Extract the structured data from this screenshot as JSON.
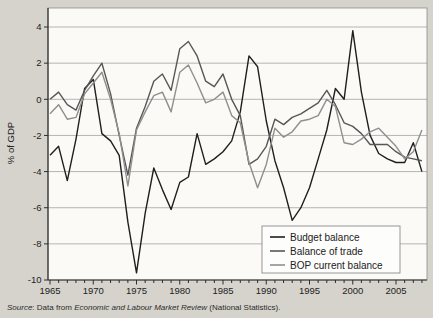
{
  "chart_data": {
    "type": "line",
    "title": "",
    "xlabel": "",
    "ylabel": "% of GDP",
    "x_start": 1965,
    "x_end": 2008,
    "ylim": [
      -10,
      5
    ],
    "grid": "horizontal",
    "x_tick_labels": [
      "1965",
      "1970",
      "1975",
      "1980",
      "1985",
      "1990",
      "1995",
      "2000",
      "2005"
    ],
    "x_tick_values": [
      1965,
      1970,
      1975,
      1980,
      1985,
      1990,
      1995,
      2000,
      2005
    ],
    "x_minor_tick_every": 1,
    "y_tick_labels": [
      "4",
      "2",
      "0",
      "-2",
      "-4",
      "-6",
      "-8",
      "-10"
    ],
    "y_tick_values": [
      4,
      2,
      0,
      -2,
      -4,
      -6,
      -8,
      -10
    ],
    "y_gridline_values": [
      4,
      2,
      0,
      -2,
      -4,
      -6,
      -8
    ],
    "legend_position": "bottom-right",
    "years": [
      1965,
      1966,
      1967,
      1968,
      1969,
      1970,
      1971,
      1972,
      1973,
      1974,
      1975,
      1976,
      1977,
      1978,
      1979,
      1980,
      1981,
      1982,
      1983,
      1984,
      1985,
      1986,
      1987,
      1988,
      1989,
      1990,
      1991,
      1992,
      1993,
      1994,
      1995,
      1996,
      1997,
      1998,
      1999,
      2000,
      2001,
      2002,
      2003,
      2004,
      2005,
      2006,
      2007,
      2008
    ],
    "series": [
      {
        "name": "Budget balance",
        "color": "#1f1f1f",
        "values": [
          -3.1,
          -2.6,
          -4.5,
          -2.2,
          0.6,
          1.1,
          -1.9,
          -2.3,
          -3.1,
          -6.8,
          -9.6,
          -6.3,
          -3.8,
          -5.0,
          -6.1,
          -4.6,
          -4.3,
          -1.9,
          -3.6,
          -3.3,
          -2.9,
          -2.3,
          -0.7,
          2.4,
          1.8,
          -1.2,
          -3.4,
          -4.9,
          -6.7,
          -6.0,
          -4.9,
          -3.3,
          -1.7,
          0.6,
          0.0,
          3.8,
          0.4,
          -2.0,
          -3.0,
          -3.3,
          -3.5,
          -3.5,
          -2.4,
          -4.0
        ]
      },
      {
        "name": "Balance of trade",
        "color": "#575757",
        "values": [
          0.0,
          0.4,
          -0.3,
          -0.6,
          0.5,
          1.3,
          2.0,
          0.3,
          -2.0,
          -4.2,
          -1.6,
          -0.4,
          1.0,
          1.4,
          0.5,
          2.8,
          3.2,
          2.4,
          1.0,
          0.7,
          1.4,
          0.0,
          -0.9,
          -3.6,
          -3.3,
          -2.6,
          -1.1,
          -1.4,
          -1.0,
          -0.8,
          -0.5,
          -0.2,
          0.5,
          -0.3,
          -1.3,
          -1.5,
          -1.9,
          -2.5,
          -2.5,
          -2.5,
          -2.9,
          -3.2,
          -3.3,
          -3.4
        ]
      },
      {
        "name": "BOP current balance",
        "color": "#8f8f8f",
        "values": [
          -0.8,
          -0.3,
          -1.1,
          -1.0,
          0.3,
          0.9,
          1.5,
          0.0,
          -1.9,
          -4.8,
          -1.7,
          -0.7,
          0.2,
          0.4,
          -0.7,
          1.5,
          1.9,
          0.9,
          -0.2,
          0.0,
          0.4,
          -0.9,
          -1.3,
          -3.5,
          -4.9,
          -3.6,
          -1.6,
          -2.1,
          -1.8,
          -1.2,
          -1.1,
          -0.9,
          0.0,
          -0.4,
          -2.4,
          -2.5,
          -2.2,
          -1.8,
          -1.6,
          -2.1,
          -2.6,
          -3.3,
          -2.9,
          -1.7
        ]
      }
    ],
    "source_note": {
      "source_word": "Source",
      "middle_text": ": Data from ",
      "journal_title": "Economic and Labour Market Review",
      "end_text": " (National Statistics)."
    },
    "colors": {
      "page_background": "#d6d3cc",
      "plot_background": "#fbfaf7",
      "gridline": "#a3a3a3",
      "axis": "#2e2e2e",
      "border": "#8c8c8c",
      "legend_background": "#fdfdfb",
      "legend_border": "#8c8c8c",
      "text": "#222222"
    }
  }
}
